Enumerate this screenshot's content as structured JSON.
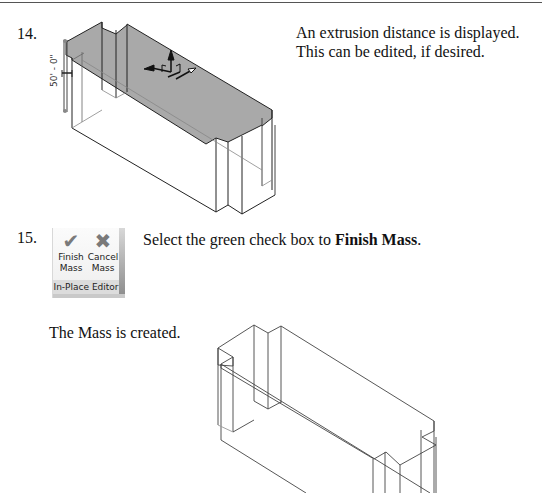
{
  "steps": [
    {
      "number": "14.",
      "text_line1": "An extrusion distance is displayed.",
      "text_line2": "This can be edited, if desired.",
      "figure": {
        "dimension_label": "50' - 0\"",
        "icon": "move-gizmo-icon",
        "top_fill": "#a9a9a9"
      }
    },
    {
      "number": "15.",
      "text_prefix": "Select the green check box to ",
      "text_bold": "Finish Mass",
      "text_suffix": ".",
      "ribbon": {
        "finish_line1": "Finish",
        "finish_line2": "Mass",
        "cancel_line1": "Cancel",
        "cancel_line2": "Mass",
        "panel_label": "In-Place Editor",
        "finish_icon": "check-icon",
        "cancel_icon": "x-icon"
      },
      "result_text": "The Mass is created."
    }
  ]
}
